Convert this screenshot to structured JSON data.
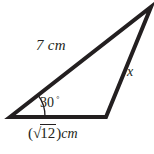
{
  "figure": {
    "stroke_color": "#231f20",
    "background_color": "#ffffff",
    "stroke_width": 4,
    "arc_stroke_width": 1.3,
    "vertices": {
      "left": [
        10,
        117
      ],
      "bottom_right": [
        106,
        117
      ],
      "apex": [
        151,
        7
      ]
    }
  },
  "labels": {
    "hypotenuse": "7 cm",
    "side_x": "x",
    "angle_value": "30",
    "angle_degree_symbol": "°",
    "base_open_paren": "(",
    "base_radical_sign": "√",
    "base_radicand": "12",
    "base_close_paren": ")",
    "base_unit": "cm"
  }
}
